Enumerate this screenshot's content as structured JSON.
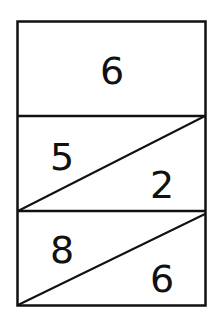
{
  "diagram": {
    "type": "number-bond-boxes",
    "cells": [
      {
        "kind": "whole",
        "value": "6"
      },
      {
        "kind": "split",
        "top_left": "5",
        "bottom_right": "2"
      },
      {
        "kind": "split",
        "top_left": "8",
        "bottom_right": "6"
      }
    ],
    "colors": {
      "line": "#111111",
      "background": "#ffffff"
    }
  }
}
